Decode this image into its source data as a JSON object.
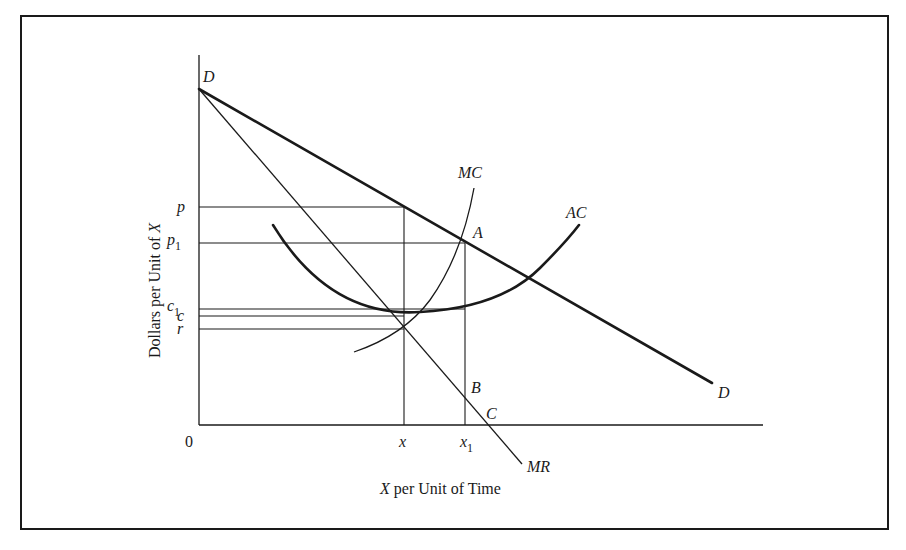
{
  "header": {
    "cutoff_caption": ""
  },
  "colors": {
    "ink": "#1a1a1a",
    "background": "#ffffff"
  },
  "diagram": {
    "frame": {
      "x1": 21,
      "y1": 16,
      "x2": 888,
      "y2": 529
    },
    "axes": {
      "origin": {
        "x": 199,
        "y": 425
      },
      "y_top": 55,
      "x_end": 763,
      "origin_label": "0",
      "y_axis_title": "Dollars per Unit of X",
      "y_axis_title_parts": [
        "Dollars per Unit of ",
        "X"
      ],
      "x_axis_title": "X per Unit of Time",
      "x_axis_title_parts": [
        "X",
        " per Unit of Time"
      ]
    },
    "curves": {
      "demand": {
        "label": "D",
        "start": {
          "x": 199,
          "y": 89
        },
        "end": {
          "x": 712,
          "y": 383
        },
        "start_label": "D",
        "end_label": "D",
        "stroke_width": 2.6
      },
      "marginal_revenue": {
        "label": "MR",
        "start": {
          "x": 199,
          "y": 89
        },
        "end": {
          "x": 522,
          "y": 464
        },
        "stroke_width": 1.3
      },
      "marginal_cost": {
        "label": "MC",
        "path": "M354,352 Q404,335 430,300 Q462,255 474,188",
        "stroke_width": 1.3
      },
      "average_cost": {
        "label": "AC",
        "path": "M273,225 Q330,318 420,312 Q500,308 540,268 Q566,242 579,225",
        "stroke_width": 2.6
      }
    },
    "y_levels": [
      {
        "label": "p",
        "sub": "",
        "y": 207,
        "x_end": 404
      },
      {
        "label": "p",
        "sub": "1",
        "y": 243,
        "x_end": 465
      },
      {
        "label": "c",
        "sub": "1",
        "y": 309,
        "x_end": 465
      },
      {
        "label": "c",
        "sub": "",
        "y": 316,
        "x_end": 404
      },
      {
        "label": "r",
        "sub": "",
        "y": 329,
        "x_end": 404
      }
    ],
    "x_levels": [
      {
        "label": "x",
        "sub": "",
        "x": 404,
        "y_top": 207
      },
      {
        "label": "x",
        "sub": "1",
        "x": 465,
        "y_top": 243
      }
    ],
    "points": [
      {
        "label": "A",
        "x": 465,
        "y": 243,
        "label_dx": 8,
        "label_dy": -5
      },
      {
        "label": "B",
        "x": 465,
        "y": 398,
        "label_dx": 6,
        "label_dy": -5
      },
      {
        "label": "C",
        "x": 488,
        "y": 425,
        "label_dx": -2,
        "label_dy": -6
      }
    ],
    "curve_labels": [
      {
        "label": "MC",
        "x": 458,
        "y": 178
      },
      {
        "label": "AC",
        "x": 566,
        "y": 218
      },
      {
        "label": "MR",
        "x": 527,
        "y": 472
      },
      {
        "label": "D",
        "x": 718,
        "y": 398
      },
      {
        "label": "D",
        "x": 203,
        "y": 82
      }
    ]
  }
}
